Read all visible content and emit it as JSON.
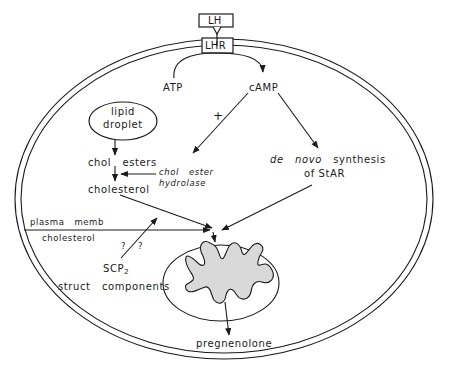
{
  "diagram": {
    "type": "cell signaling pathway",
    "receptor": {
      "ligand": "LH",
      "receptor": "LHR"
    },
    "nodes": {
      "atp": "ATP",
      "camp": "cAMP",
      "plus_sign": "+",
      "lipid_droplet_line1": "lipid",
      "lipid_droplet_line2": "droplet",
      "chol_esters": "chol   esters",
      "cholesterol": "cholesterol",
      "hydrolase_line1": "chol   ester",
      "hydrolase_line2": "hydrolase",
      "star_italic": "de   novo",
      "star_line1_rest": "synthesis",
      "star_line2": "of StAR",
      "plasma_memb": "plasma   memb",
      "plasma_chol": "cholesterol",
      "question1": "?",
      "question2": "?",
      "scp": "SCP",
      "scp_sub": "2",
      "struct_components": "struct   components",
      "pregnenolone": "pregnenolone"
    },
    "edges": [
      {
        "from": "LHR",
        "to": "cAMP",
        "via": "ATP"
      },
      {
        "from": "cAMP",
        "to": "chol ester hydrolase",
        "label": "+"
      },
      {
        "from": "cAMP",
        "to": "de novo synthesis of StAR"
      },
      {
        "from": "lipid droplet",
        "to": "chol esters"
      },
      {
        "from": "chol esters",
        "to": "cholesterol"
      },
      {
        "from": "chol ester hydrolase",
        "to": "cholesterol"
      },
      {
        "from": "cholesterol",
        "to": "mitochondrion"
      },
      {
        "from": "de novo synthesis of StAR",
        "to": "mitochondrion"
      },
      {
        "from": "plasma memb cholesterol",
        "to": "mitochondrion"
      },
      {
        "from": "SCP2",
        "to": "cholesterol transport",
        "label": "? ?"
      },
      {
        "from": "mitochondrion",
        "to": "pregnenolone"
      }
    ],
    "colors": {
      "line": "#1a1a1a",
      "mito_fill": "#d9d9d9",
      "background": "#ffffff"
    }
  }
}
